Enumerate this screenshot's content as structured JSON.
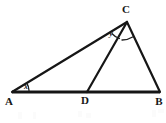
{
  "figure": {
    "background_color": "#ffffff",
    "stroke_color": "#161616",
    "width": 166,
    "height": 123
  },
  "points": {
    "A": {
      "label": "A",
      "x": 12,
      "y": 92,
      "label_x": 9,
      "label_y": 105
    },
    "B": {
      "label": "B",
      "x": 160,
      "y": 92,
      "label_x": 157,
      "label_y": 105
    },
    "C": {
      "label": "C",
      "x": 127,
      "y": 22,
      "label_x": 123,
      "label_y": 13
    },
    "D": {
      "label": "D",
      "x": 87,
      "y": 92,
      "label_x": 83,
      "label_y": 104
    }
  },
  "segments": [
    {
      "name": "AB",
      "from": "A",
      "to": "B",
      "stroke_width": 3.0
    },
    {
      "name": "AC",
      "from": "A",
      "to": "C",
      "stroke_width": 2.2
    },
    {
      "name": "CB",
      "from": "C",
      "to": "B",
      "stroke_width": 2.2
    },
    {
      "name": "CD",
      "from": "C",
      "to": "D",
      "stroke_width": 2.2
    }
  ],
  "angles": [
    {
      "name": "angle-x-at-A",
      "label": "x",
      "vertex": "A",
      "between": [
        "AB",
        "AC"
      ],
      "label_x": 26,
      "label_y": 89,
      "arc_path": "M 29 90.5 A 17 17 0 0 0 26.6 82.6"
    },
    {
      "name": "angle-y-at-C",
      "label": "y",
      "vertex": "C",
      "between": [
        "CA",
        "CD"
      ],
      "label_x": 111,
      "label_y": 36,
      "arc_path": "M 112.1 33.7 A 18 18 0 0 0 119.4 38.5"
    },
    {
      "name": "angle-unlabeled-at-C",
      "label": "",
      "vertex": "C",
      "between": [
        "CD",
        "CB"
      ],
      "label_x": 0,
      "label_y": 0,
      "arc_path": "M 122.0 40.0 A 19.5 19.5 0 0 0 132.6 37.0"
    }
  ],
  "artifacts": [
    {
      "name": "faint-mark-1",
      "x": 18,
      "y": 112,
      "w": 4,
      "h": 7
    },
    {
      "name": "faint-mark-2",
      "x": 33,
      "y": 112,
      "w": 3,
      "h": 7
    },
    {
      "name": "faint-mark-3",
      "x": 78,
      "y": 111,
      "w": 4,
      "h": 6
    },
    {
      "name": "faint-mark-4",
      "x": 86,
      "y": 113,
      "w": 5,
      "h": 5
    },
    {
      "name": "faint-mark-5",
      "x": 152,
      "y": 110,
      "w": 4,
      "h": 7
    },
    {
      "name": "faint-mark-6",
      "x": 158,
      "y": 109,
      "w": 6,
      "h": 4
    }
  ]
}
